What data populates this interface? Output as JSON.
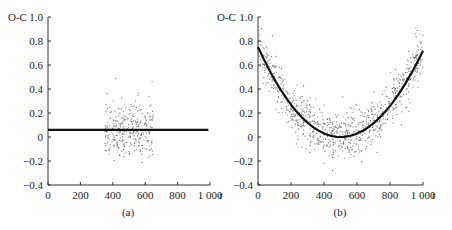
{
  "chart_data": [
    {
      "type": "scatter",
      "panel_label": "(a)",
      "ylabel": "O-C",
      "xlabel": "t",
      "xlim": [
        0,
        1000
      ],
      "ylim": [
        -0.4,
        1.0
      ],
      "xticks": [
        0,
        200,
        400,
        600,
        800,
        1000
      ],
      "xtick_labels": [
        "0",
        "200",
        "400",
        "600",
        "800",
        "1 000"
      ],
      "yticks": [
        -0.4,
        -0.2,
        0,
        0.2,
        0.4,
        0.6,
        0.8,
        1.0
      ],
      "ytick_labels": [
        "-0.4",
        "-0.2",
        "0",
        "0.2",
        "0.4",
        "0.6",
        "0.8",
        "1.0"
      ],
      "grid": false,
      "fit_line": {
        "type": "constant",
        "value": 0.06,
        "x_range": [
          0,
          990
        ]
      },
      "scatter": {
        "x_range": [
          350,
          650
        ],
        "center": 0.05,
        "spread": 0.11,
        "count": 320,
        "seed": 7
      }
    },
    {
      "type": "scatter",
      "panel_label": "(b)",
      "ylabel": "O-C",
      "xlabel": "t",
      "xlim": [
        0,
        1000
      ],
      "ylim": [
        -0.4,
        1.0
      ],
      "xticks": [
        0,
        200,
        400,
        600,
        800,
        1000
      ],
      "xtick_labels": [
        "0",
        "200",
        "400",
        "600",
        "800",
        "1 000"
      ],
      "yticks": [
        -0.4,
        -0.2,
        0,
        0.2,
        0.4,
        0.6,
        0.8,
        1.0
      ],
      "ytick_labels": [
        "-0.4",
        "-0.2",
        "0",
        "0.2",
        "0.4",
        "0.6",
        "0.8",
        "1.0"
      ],
      "grid": false,
      "fit_line": {
        "type": "quadratic",
        "vertex_t": 500,
        "vertex_value": 0.0,
        "value_at_0": 0.75,
        "value_at_1000": 0.72,
        "x_range": [
          0,
          1000
        ]
      },
      "scatter": {
        "x_range": [
          0,
          1000
        ],
        "spread": 0.1,
        "count": 900,
        "seed": 13
      }
    }
  ]
}
